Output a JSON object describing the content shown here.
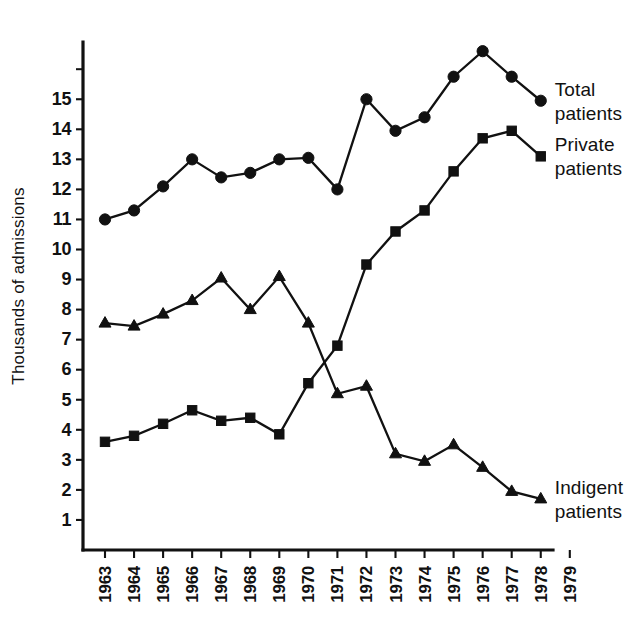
{
  "chart_data": {
    "type": "line",
    "title": "",
    "subtitle": "",
    "xlabel": "",
    "ylabel": "Thousands of admissions",
    "x": [
      1963,
      1964,
      1965,
      1966,
      1967,
      1968,
      1969,
      1970,
      1971,
      1972,
      1973,
      1974,
      1975,
      1976,
      1977,
      1978
    ],
    "xtick_labels": [
      "1963",
      "1964",
      "1965",
      "1966",
      "1967",
      "1968",
      "1969",
      "1970",
      "1971",
      "1972",
      "1973",
      "1974",
      "1975",
      "1976",
      "1977",
      "1978",
      "1979"
    ],
    "xlim": [
      1963,
      1979
    ],
    "ylim": [
      0,
      17
    ],
    "ytick_labels": [
      "15",
      "14",
      "13",
      "12",
      "11",
      "10",
      "9",
      "8",
      "7",
      "6",
      "5",
      "4",
      "3",
      "2",
      "1"
    ],
    "ytick_values": [
      15,
      14,
      13,
      12,
      11,
      10,
      9,
      8,
      7,
      6,
      5,
      4,
      3,
      2,
      1
    ],
    "grid": false,
    "legend_position": "right-inline",
    "series": [
      {
        "name": "Total patients",
        "marker": "circle",
        "label_lines": [
          "Total",
          "patients"
        ],
        "values": [
          11.0,
          11.3,
          12.1,
          13.0,
          12.4,
          12.55,
          13.0,
          13.05,
          12.0,
          15.0,
          13.95,
          14.4,
          15.75,
          16.6,
          15.75,
          14.95
        ]
      },
      {
        "name": "Private patients",
        "marker": "square",
        "label_lines": [
          "Private",
          "patients"
        ],
        "values": [
          3.6,
          3.8,
          4.2,
          4.65,
          4.3,
          4.4,
          3.85,
          5.55,
          6.8,
          9.5,
          10.6,
          11.3,
          12.6,
          13.7,
          13.95,
          13.1
        ]
      },
      {
        "name": "Indigent patients",
        "marker": "triangle",
        "label_lines": [
          "Indigent",
          "patients"
        ],
        "values": [
          7.55,
          7.45,
          7.85,
          8.3,
          9.05,
          8.0,
          9.1,
          7.55,
          5.2,
          5.45,
          3.2,
          2.95,
          3.5,
          2.75,
          1.95,
          1.7
        ]
      }
    ],
    "axis_colors": {
      "line": "#111111",
      "text": "#111111",
      "background": "#ffffff"
    },
    "geometry": {
      "x_origin_px": 105,
      "x_step_px": 29.05,
      "y_zero_px": 550,
      "y_unit_px": 30.05,
      "axis_left_px": 83,
      "axis_top_px": 42,
      "axis_right_px": 553
    }
  }
}
